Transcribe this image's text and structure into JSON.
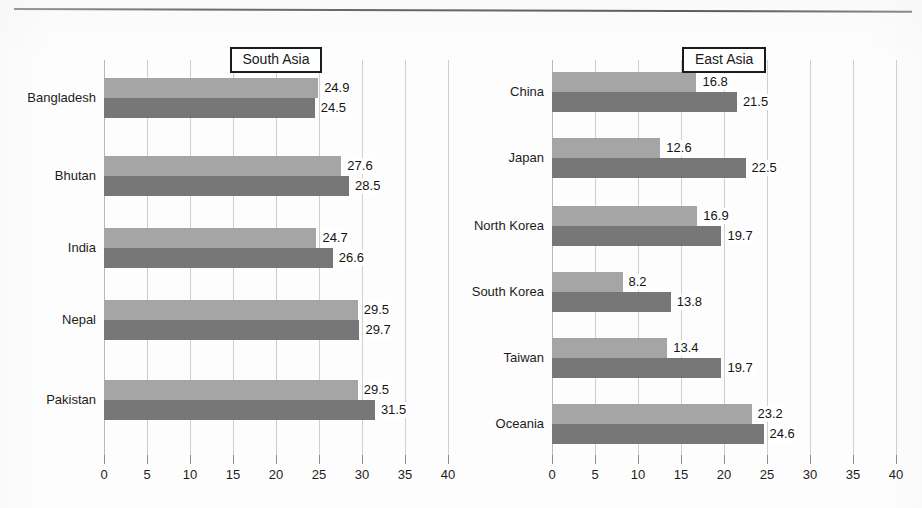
{
  "chart_data": [
    {
      "type": "bar",
      "orientation": "horizontal",
      "title": "South Asia",
      "xlabel": "",
      "ylabel": "",
      "xlim": [
        0,
        40
      ],
      "xticks": [
        0,
        5,
        10,
        15,
        20,
        25,
        30,
        35,
        40
      ],
      "grid": true,
      "legend": "none",
      "categories": [
        "Bangladesh",
        "Bhutan",
        "India",
        "Nepal",
        "Pakistan"
      ],
      "series": [
        {
          "name": "series-1",
          "color": "#a5a5a5",
          "values": [
            24.9,
            27.6,
            24.7,
            29.5,
            29.5
          ]
        },
        {
          "name": "series-2",
          "color": "#777777",
          "values": [
            24.5,
            28.5,
            26.6,
            29.7,
            31.5
          ]
        }
      ]
    },
    {
      "type": "bar",
      "orientation": "horizontal",
      "title": "East Asia",
      "xlabel": "",
      "ylabel": "",
      "xlim": [
        0,
        40
      ],
      "xticks": [
        0,
        5,
        10,
        15,
        20,
        25,
        30,
        35,
        40
      ],
      "grid": true,
      "legend": "none",
      "categories": [
        "China",
        "Japan",
        "North Korea",
        "South Korea",
        "Taiwan",
        "Oceania"
      ],
      "series": [
        {
          "name": "series-1",
          "color": "#a5a5a5",
          "values": [
            16.8,
            12.6,
            16.9,
            8.2,
            13.4,
            23.2
          ]
        },
        {
          "name": "series-2",
          "color": "#777777",
          "values": [
            21.5,
            22.5,
            19.7,
            13.8,
            19.7,
            24.6
          ]
        }
      ]
    }
  ],
  "colors": {
    "series_1": "#a5a5a5",
    "series_2": "#777777",
    "gridline": "#cfcfcf",
    "text": "#1c1c1c"
  }
}
